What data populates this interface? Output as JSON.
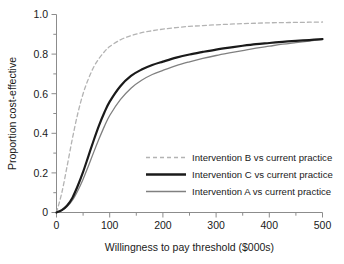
{
  "chart_data": {
    "type": "line",
    "title": "",
    "xlabel": "Willingness to pay threshold ($000s)",
    "ylabel": "Proportion cost-effective",
    "xlim": [
      0,
      500
    ],
    "ylim": [
      0,
      1.0
    ],
    "grid": false,
    "legend_position": "center-right",
    "xticks": [
      0,
      100,
      200,
      300,
      400,
      500
    ],
    "xtick_labels": [
      "0",
      "100",
      "200",
      "300",
      "400",
      "500"
    ],
    "xminor_step": 50,
    "yticks": [
      0,
      0.2,
      0.4,
      0.6,
      0.8,
      1.0
    ],
    "ytick_labels": [
      "0",
      "0.2",
      "0.4",
      "0.6",
      "0.8",
      "1.0"
    ],
    "yminor_step": 0.1,
    "x": [
      0,
      10,
      20,
      30,
      40,
      50,
      60,
      70,
      80,
      90,
      100,
      120,
      140,
      160,
      180,
      200,
      225,
      250,
      275,
      300,
      325,
      350,
      375,
      400,
      425,
      450,
      475,
      500
    ],
    "series": [
      {
        "name": "Intervention B vs current practice",
        "style": "dashed",
        "color": "#b3b3b3",
        "width": 1.3,
        "values": [
          0.0,
          0.1,
          0.235,
          0.375,
          0.5,
          0.6,
          0.675,
          0.735,
          0.778,
          0.812,
          0.838,
          0.872,
          0.893,
          0.908,
          0.918,
          0.926,
          0.934,
          0.94,
          0.944,
          0.948,
          0.951,
          0.954,
          0.956,
          0.958,
          0.959,
          0.96,
          0.961,
          0.962
        ]
      },
      {
        "name": "Intervention C vs current practice",
        "style": "solid",
        "color": "#1a1a1a",
        "width": 2.2,
        "values": [
          0.0,
          0.012,
          0.035,
          0.075,
          0.135,
          0.205,
          0.285,
          0.365,
          0.44,
          0.505,
          0.56,
          0.638,
          0.69,
          0.722,
          0.745,
          0.762,
          0.782,
          0.798,
          0.811,
          0.823,
          0.833,
          0.842,
          0.85,
          0.856,
          0.862,
          0.867,
          0.871,
          0.876
        ]
      },
      {
        "name": "Intervention A vs current practice",
        "style": "solid",
        "color": "#808080",
        "width": 1.3,
        "values": [
          0.0,
          0.01,
          0.03,
          0.062,
          0.11,
          0.168,
          0.235,
          0.305,
          0.372,
          0.435,
          0.49,
          0.57,
          0.628,
          0.668,
          0.697,
          0.718,
          0.742,
          0.761,
          0.778,
          0.793,
          0.806,
          0.818,
          0.83,
          0.84,
          0.85,
          0.858,
          0.866,
          0.874
        ]
      }
    ],
    "legend": [
      {
        "label": "Intervention B vs current practice",
        "style": "dashed",
        "color": "#b3b3b3",
        "width": 1.3
      },
      {
        "label": "Intervention C vs current practice",
        "style": "solid",
        "color": "#1a1a1a",
        "width": 2.4
      },
      {
        "label": "Intervention A vs current practice",
        "style": "solid",
        "color": "#808080",
        "width": 1.3
      }
    ]
  }
}
